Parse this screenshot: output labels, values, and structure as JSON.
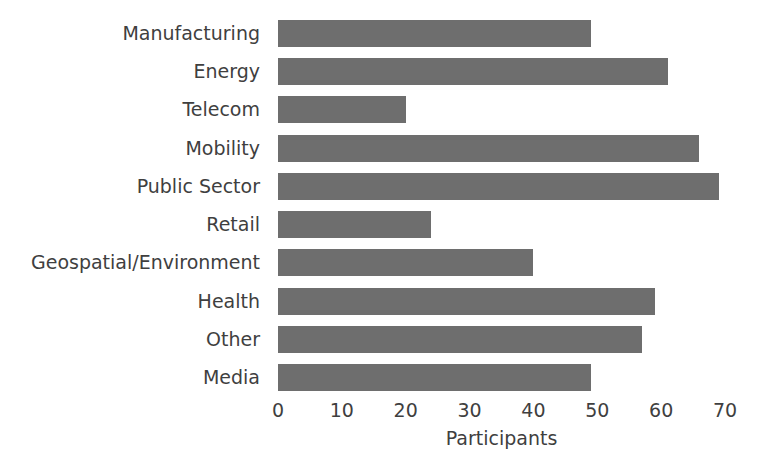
{
  "chart_data": {
    "type": "bar",
    "orientation": "horizontal",
    "title": "",
    "subtitle": "",
    "xlabel": "Participants",
    "ylabel": "",
    "categories": [
      "Manufacturing",
      "Energy",
      "Telecom",
      "Mobility",
      "Public Sector",
      "Retail",
      "Geospatial/Environment",
      "Health",
      "Other",
      "Media"
    ],
    "values": [
      49,
      61,
      20,
      66,
      69,
      24,
      40,
      59,
      57,
      49
    ],
    "xlim": [
      0,
      70
    ],
    "xticks": [
      0,
      10,
      20,
      30,
      40,
      50,
      60,
      70
    ],
    "xtick_labels": [
      "0",
      "10",
      "20",
      "30",
      "40",
      "50",
      "60",
      "70"
    ],
    "grid": false,
    "legend": null,
    "legend_position": "none",
    "bar_color": "#6e6e6e",
    "text_color": "#3f3f3f",
    "background_color": "#ffffff"
  }
}
